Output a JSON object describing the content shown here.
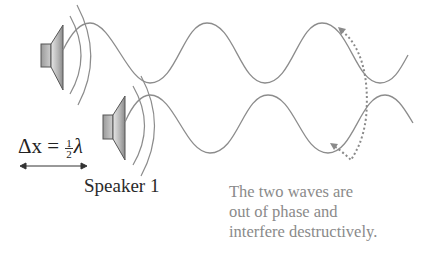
{
  "diagram": {
    "delta_x": {
      "lhs": "Δx",
      "equals": "=",
      "frac_num": "1",
      "frac_den": "2",
      "symbol": "λ"
    },
    "speaker_label": "Speaker 1",
    "note_lines": [
      "The two waves are",
      "out of phase and",
      "interfere destructively."
    ],
    "colors": {
      "wave": "#8c8c8c",
      "speaker_dark": "#6e6e6e",
      "speaker_light": "#d8d8d8",
      "dotted_arrow": "#8a8a8a",
      "note_text": "#8a8a8a",
      "label_text": "#2a2a2a"
    },
    "speakers": [
      {
        "name": "top-speaker",
        "x": 41,
        "y": 25
      },
      {
        "name": "bottom-speaker",
        "x": 103,
        "y": 96
      }
    ],
    "waves": {
      "wavelength_px": 116,
      "top_wave": {
        "peaks_x": [
          90,
          205,
          322
        ],
        "troughs_x": [
          150,
          265,
          380
        ],
        "peak_y": 23,
        "trough_y": 83
      },
      "bottom_wave": {
        "peaks_x": [
          150,
          268,
          385
        ],
        "troughs_x": [
          210,
          328
        ],
        "peak_y": 95,
        "trough_y": 153
      }
    }
  }
}
